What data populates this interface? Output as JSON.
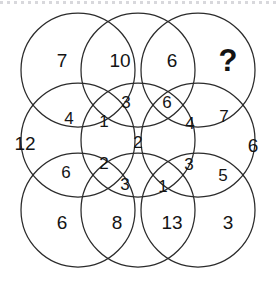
{
  "figure": {
    "kind": "circle-overlap-number-puzzle",
    "background_color": "#ffffff",
    "stroke_color": "#2b2b2b",
    "text_color": "#141414",
    "rule_color": "#d8d8dc"
  },
  "geometry": {
    "circle_radius": 57,
    "centers_x": [
      78,
      138,
      198
    ],
    "centers_y": [
      70,
      140,
      210
    ],
    "circle_count": 9
  },
  "cells": [
    {
      "id": "r1c1-outer",
      "value": "7",
      "x": 62,
      "y": 60,
      "size": "outer"
    },
    {
      "id": "r1c2-outer",
      "value": "10",
      "x": 120,
      "y": 60,
      "size": "outer"
    },
    {
      "id": "r1c3-outer",
      "value": "6",
      "x": 172,
      "y": 60,
      "size": "outer"
    },
    {
      "id": "r1c4-answer",
      "value": "?",
      "x": 228,
      "y": 60,
      "size": "question"
    },
    {
      "id": "r2-left-lobe",
      "value": "4",
      "x": 69,
      "y": 118,
      "size": "mid"
    },
    {
      "id": "r2-mid-upper",
      "value": "3",
      "x": 126,
      "y": 102,
      "size": "mid"
    },
    {
      "id": "r2-upper-core",
      "value": "1",
      "x": 104,
      "y": 121,
      "size": "mid"
    },
    {
      "id": "r2-right-upper",
      "value": "6",
      "x": 167,
      "y": 102,
      "size": "mid"
    },
    {
      "id": "r2-right-lobe",
      "value": "4",
      "x": 190,
      "y": 123,
      "size": "mid"
    },
    {
      "id": "r2-far-right",
      "value": "7",
      "x": 224,
      "y": 116,
      "size": "mid"
    },
    {
      "id": "r3-far-left",
      "value": "12",
      "x": 25,
      "y": 143,
      "size": "outer"
    },
    {
      "id": "r3-center",
      "value": "2",
      "x": 138,
      "y": 142,
      "size": "mid"
    },
    {
      "id": "r3-far-right",
      "value": "6",
      "x": 253,
      "y": 145,
      "size": "outer"
    },
    {
      "id": "r4-left-lobe",
      "value": "6",
      "x": 66,
      "y": 172,
      "size": "mid"
    },
    {
      "id": "r4-lower-core",
      "value": "2",
      "x": 104,
      "y": 163,
      "size": "mid"
    },
    {
      "id": "r4-mid-lower",
      "value": "3",
      "x": 125,
      "y": 184,
      "size": "mid"
    },
    {
      "id": "r4-right-lower",
      "value": "1",
      "x": 163,
      "y": 186,
      "size": "mid"
    },
    {
      "id": "r4-right-lobe",
      "value": "3",
      "x": 189,
      "y": 164,
      "size": "mid"
    },
    {
      "id": "r4-far-right",
      "value": "5",
      "x": 223,
      "y": 175,
      "size": "mid"
    },
    {
      "id": "r5c1-outer",
      "value": "6",
      "x": 62,
      "y": 222,
      "size": "outer"
    },
    {
      "id": "r5c2-outer",
      "value": "8",
      "x": 117,
      "y": 222,
      "size": "outer"
    },
    {
      "id": "r5c3-outer",
      "value": "13",
      "x": 172,
      "y": 222,
      "size": "outer"
    },
    {
      "id": "r5c4-outer",
      "value": "3",
      "x": 228,
      "y": 222,
      "size": "outer"
    }
  ]
}
